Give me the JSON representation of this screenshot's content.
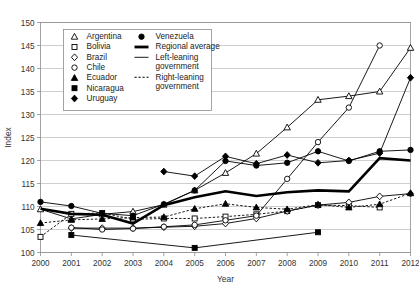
{
  "chart_data": {
    "type": "line",
    "title": "",
    "xlabel": "Year",
    "ylabel": "Index",
    "xlim": [
      2000,
      2012
    ],
    "ylim": [
      100,
      150
    ],
    "ytick_step": 5,
    "grid": true,
    "legend_position": "top-left-inside",
    "x": [
      2000,
      2001,
      2002,
      2003,
      2004,
      2005,
      2006,
      2007,
      2008,
      2009,
      2010,
      2011,
      2012
    ],
    "xtick_labels": [
      "2000",
      "2001",
      "2002",
      "2003",
      "2004",
      "2005",
      "2006",
      "2007",
      "2008",
      "2009",
      "2010",
      "2011",
      "2012"
    ],
    "ytick_labels": [
      "100",
      "105",
      "110",
      "115",
      "120",
      "125",
      "130",
      "135",
      "140",
      "145",
      "150"
    ],
    "series": [
      {
        "name": "Argentina",
        "marker": "triangle-open",
        "linestyle": "solid",
        "lean": "left",
        "x": [
          2000,
          2001,
          2002,
          2003,
          2004,
          2005,
          2006,
          2007,
          2008,
          2009,
          2010,
          2011,
          2012
        ],
        "values": [
          109.4,
          107.3,
          108.3,
          108.9,
          110.4,
          113.5,
          117.3,
          121.5,
          127.2,
          133.2,
          134.0,
          135.0,
          144.5
        ]
      },
      {
        "name": "Bolivia",
        "marker": "square-open",
        "linestyle": "dashed",
        "lean": "right",
        "x": [
          2000,
          2001,
          2002,
          2003,
          2004,
          2005,
          2006,
          2007,
          2008,
          2009,
          2010,
          2011
        ],
        "values": [
          103.4,
          108.4,
          108.6,
          107.2,
          107.4,
          107.4,
          107.8,
          108.3,
          109.0,
          110.3,
          110.2,
          109.8
        ]
      },
      {
        "name": "Brazil",
        "marker": "diamond-open",
        "linestyle": "solid",
        "lean": "left",
        "x": [
          2001,
          2002,
          2003,
          2004,
          2005,
          2006,
          2007,
          2008,
          2009,
          2010,
          2011,
          2012
        ],
        "values": [
          105.3,
          105.3,
          105.3,
          105.5,
          105.7,
          106.3,
          107.4,
          109.0,
          110.3,
          110.9,
          112.2,
          112.8
        ]
      },
      {
        "name": "Chile",
        "marker": "circle-open",
        "linestyle": "solid",
        "lean": "left",
        "x": [
          2001,
          2002,
          2003,
          2004,
          2005,
          2006,
          2007,
          2008,
          2009,
          2010,
          2011
        ],
        "values": [
          105.4,
          105.0,
          105.2,
          105.6,
          106.0,
          107.0,
          108.0,
          116.0,
          124.0,
          131.5,
          145.0
        ]
      },
      {
        "name": "Ecuador",
        "marker": "triangle-solid",
        "linestyle": "dashed",
        "lean": "right",
        "x": [
          2000,
          2001,
          2002,
          2003,
          2004,
          2005,
          2006,
          2007,
          2008,
          2009,
          2010,
          2011,
          2012
        ],
        "values": [
          106.4,
          107.1,
          107.3,
          107.6,
          107.7,
          109.5,
          110.6,
          109.8,
          109.4,
          110.4,
          109.8,
          110.5,
          112.9
        ]
      },
      {
        "name": "Nicaragua",
        "marker": "square-solid",
        "linestyle": "solid",
        "lean": "left",
        "x": [
          2001,
          2005,
          2009
        ],
        "values": [
          103.8,
          101.0,
          104.4
        ]
      },
      {
        "name": "Uruguay",
        "marker": "diamond-solid",
        "linestyle": "solid",
        "lean": "left",
        "x": [
          2004,
          2005,
          2006,
          2007,
          2008,
          2009,
          2010,
          2011,
          2012
        ],
        "values": [
          117.6,
          116.6,
          120.9,
          119.3,
          121.2,
          119.5,
          120.0,
          121.6,
          138.0
        ]
      },
      {
        "name": "Venezuela",
        "marker": "circle-solid",
        "linestyle": "solid",
        "lean": "left",
        "x": [
          2000,
          2001,
          2002,
          2003,
          2004,
          2005,
          2006,
          2007,
          2008,
          2009,
          2010,
          2011,
          2012
        ],
        "values": [
          111.0,
          110.1,
          108.5,
          108.0,
          110.5,
          113.5,
          119.9,
          118.9,
          119.5,
          122.0,
          119.9,
          122.0,
          122.3
        ]
      },
      {
        "name": "Regional average",
        "marker": "none",
        "linestyle": "thick",
        "lean": "",
        "x": [
          2000,
          2001,
          2002,
          2003,
          2004,
          2005,
          2006,
          2007,
          2008,
          2009,
          2010,
          2011,
          2012
        ],
        "values": [
          109.5,
          108.4,
          108.2,
          106.3,
          110.3,
          112.0,
          113.3,
          112.3,
          113.1,
          113.5,
          113.3,
          120.5,
          120.0
        ]
      }
    ],
    "legend": {
      "column1": [
        {
          "label": "Argentina",
          "marker": "triangle-open"
        },
        {
          "label": "Bolivia",
          "marker": "square-open"
        },
        {
          "label": "Brazil",
          "marker": "diamond-open"
        },
        {
          "label": "Chile",
          "marker": "circle-open"
        },
        {
          "label": "Ecuador",
          "marker": "triangle-solid"
        },
        {
          "label": "Nicaragua",
          "marker": "square-solid"
        },
        {
          "label": "Uruguay",
          "marker": "diamond-solid"
        }
      ],
      "column2": [
        {
          "label": "Venezuela",
          "marker": "circle-solid"
        },
        {
          "label": "Regional average",
          "marker": "thick-line"
        },
        {
          "label": "Left-leaning government",
          "marker": "thin-line"
        },
        {
          "label": "Right-leaning government",
          "marker": "dotted-line"
        }
      ]
    }
  }
}
